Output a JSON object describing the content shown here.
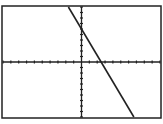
{
  "chart_data": {
    "type": "line",
    "title": "",
    "xlabel": "",
    "ylabel": "",
    "xlim": [
      -10,
      10
    ],
    "ylim": [
      -10,
      10
    ],
    "xscl": 1,
    "yscl": 1,
    "grid": false,
    "legend": null,
    "series": [
      {
        "name": "Y1",
        "equation": "y = -2.4x + 6",
        "slope": -2.4,
        "intercept": 6,
        "x": [
          -1.67,
          6.67
        ],
        "y": [
          10,
          -10
        ]
      }
    ],
    "annotations": []
  },
  "style": {
    "frame_color": "#222222",
    "axis_color": "#222222",
    "line_color": "#222222",
    "background": "#ffffff"
  }
}
